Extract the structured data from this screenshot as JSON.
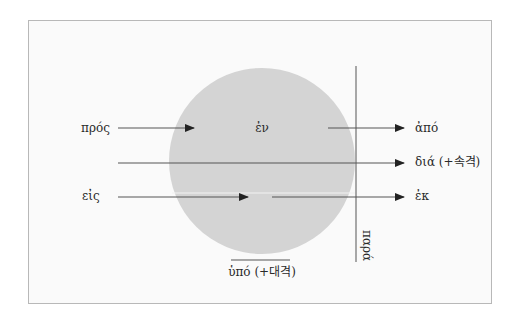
{
  "diagram": {
    "type": "preposition-spatial-diagram",
    "colors": {
      "background": "#ffffff",
      "frame_fill": "#fafafa",
      "frame_border": "#b8b8b8",
      "circle_fill": "#d4d4d4",
      "line": "#555555",
      "text": "#2a2a2a"
    },
    "center_label": "ἐν",
    "labels": {
      "pros": "πρός",
      "en": "ἐν",
      "apo": "ἀπό",
      "dia": "διά (+속격)",
      "eis": "εἰς",
      "ek": "ἐκ",
      "hypo": "ὑπό (+대격)",
      "para": "παρά"
    },
    "arrows": [
      {
        "id": "pros",
        "label": "πρός",
        "from": "outside-left",
        "to": "circle-edge"
      },
      {
        "id": "apo",
        "label": "ἀπό",
        "from": "circle-edge",
        "to": "outside-right"
      },
      {
        "id": "dia",
        "label": "διά (+속격)",
        "from": "outside-left",
        "to": "outside-right",
        "through": "circle"
      },
      {
        "id": "eis",
        "label": "εἰς",
        "from": "outside-left",
        "to": "circle-inside"
      },
      {
        "id": "ek",
        "label": "ἐκ",
        "from": "circle-inside",
        "to": "outside-right"
      }
    ],
    "lines": [
      {
        "id": "para",
        "label": "παρά",
        "orientation": "vertical",
        "position": "beside-circle"
      },
      {
        "id": "hypo",
        "label": "ὑπό (+대격)",
        "orientation": "horizontal",
        "position": "below-circle"
      }
    ]
  }
}
